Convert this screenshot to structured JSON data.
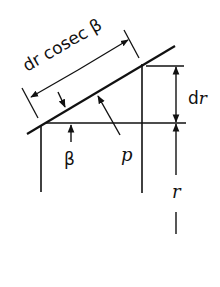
{
  "diagram": {
    "labels": {
      "slant_length": "dr cosec β",
      "dr_prefix": "d",
      "dr_var": "r",
      "beta": "β",
      "p": "p",
      "r": "r"
    },
    "colors": {
      "stroke": "#111111",
      "background": "#ffffff"
    }
  }
}
